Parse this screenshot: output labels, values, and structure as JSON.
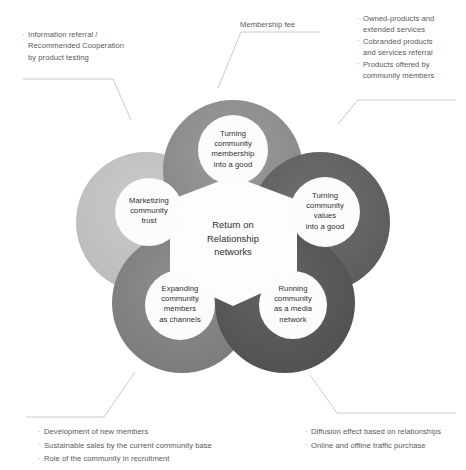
{
  "diagram": {
    "title": "Return on Relationship networks",
    "center": {
      "lines": [
        "Return on",
        "Relationship",
        "networks"
      ]
    },
    "petals": [
      {
        "id": "membership-good",
        "position": "top",
        "color": "#8f8f8f",
        "lines": [
          "Turning",
          "community",
          "membership",
          "into a good"
        ]
      },
      {
        "id": "values-good",
        "position": "right",
        "color": "#656565",
        "lines": [
          "Turning",
          "community",
          "values",
          "into a good"
        ]
      },
      {
        "id": "media-network",
        "position": "bottom-right",
        "color": "#5a5a5a",
        "lines": [
          "Running",
          "community",
          "as a media",
          "network"
        ]
      },
      {
        "id": "members-channels",
        "position": "bottom-left",
        "color": "#858585",
        "lines": [
          "Expanding",
          "community",
          "members",
          "as channels"
        ]
      },
      {
        "id": "community-trust",
        "position": "left",
        "color": "#c4c4c4",
        "lines": [
          "Marketizing",
          "community",
          "trust"
        ]
      }
    ],
    "annotations": [
      {
        "id": "top-left",
        "bulleted": true,
        "lines": [
          "Information referral /",
          "Recommended Cooperation",
          "by product testing"
        ],
        "continuation": [
          false,
          true,
          true
        ]
      },
      {
        "id": "top-center",
        "bulleted": false,
        "lines": [
          "Membership fee"
        ],
        "continuation": [
          false
        ]
      },
      {
        "id": "top-right",
        "bulleted": true,
        "lines": [
          "Owned-products and",
          "extended services",
          "Cobranded products",
          "and services referral",
          "Products offered by",
          "community members"
        ],
        "continuation": [
          false,
          true,
          false,
          true,
          false,
          true
        ]
      },
      {
        "id": "bottom-left",
        "bulleted": true,
        "lines": [
          "Development of new members",
          "Sustainable sales by the current community base",
          "Role of the community in recruitment"
        ],
        "continuation": [
          false,
          false,
          false
        ]
      },
      {
        "id": "bottom-right",
        "bulleted": true,
        "lines": [
          "Diffusion effect based on relationships",
          "Online and offline traffic purchase"
        ],
        "continuation": [
          false,
          false
        ]
      }
    ],
    "colors": {
      "leader_line": "#b5b5b5",
      "inner_circle": "#ffffff",
      "background": "#ffffff"
    }
  }
}
